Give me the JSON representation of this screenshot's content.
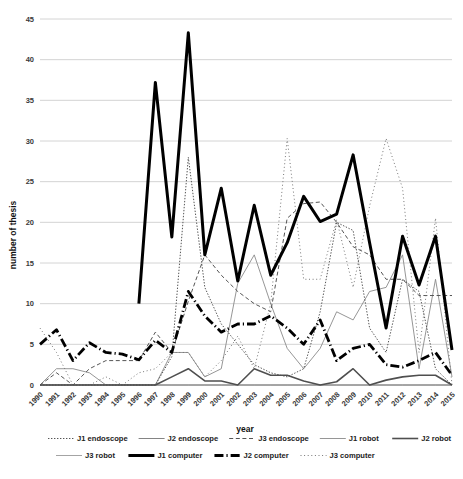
{
  "chart_data": {
    "type": "line",
    "title": "",
    "xlabel": "year",
    "ylabel": "number of thesis",
    "grid": true,
    "legend_position": "bottom",
    "ylim": [
      0,
      45
    ],
    "yticks": [
      0,
      5,
      10,
      15,
      20,
      25,
      30,
      35,
      40,
      45
    ],
    "categories": [
      "1990",
      "1991",
      "1992",
      "1993",
      "1994",
      "1995",
      "1996",
      "1997",
      "1998",
      "1999",
      "2000",
      "2001",
      "2002",
      "2003",
      "2004",
      "2005",
      "2006",
      "2007",
      "2008",
      "2009",
      "2010",
      "2011",
      "2012",
      "2013",
      "2014",
      "2015"
    ],
    "series": [
      {
        "name": "J1 endoscope",
        "style": "dotted-fine",
        "color": "#555555",
        "width": 1.0,
        "dash": "1.4,1.6",
        "values": [
          0,
          0,
          0,
          0,
          0,
          0,
          0,
          0,
          3.5,
          28,
          12,
          7.5,
          5,
          2.5,
          1.5,
          1,
          2,
          9,
          20,
          19,
          7,
          4,
          13,
          11.5,
          2,
          0
        ]
      },
      {
        "name": "J2 endoscope",
        "style": "thin-solid",
        "color": "#6e6e6e",
        "width": 0.85,
        "dash": "",
        "values": [
          0,
          0,
          0,
          0,
          0,
          0,
          0,
          0,
          0,
          0,
          0,
          0,
          0,
          0,
          0,
          0,
          0,
          0,
          0,
          0,
          0,
          0,
          0,
          0,
          0,
          0
        ]
      },
      {
        "name": "J3 endoscope",
        "style": "dashed",
        "color": "#555555",
        "width": 1.0,
        "dash": "4,2.6",
        "values": [
          0,
          1.5,
          0,
          2,
          3,
          3,
          3,
          6.5,
          4,
          10.3,
          16,
          13.5,
          11.5,
          10,
          9,
          20.5,
          22.3,
          22.5,
          20,
          17,
          16,
          13,
          13,
          11,
          11,
          11
        ]
      },
      {
        "name": "J1 robot",
        "style": "thin-solid",
        "color": "#8a8a8a",
        "width": 0.9,
        "dash": "",
        "values": [
          0,
          2,
          2,
          1.5,
          0,
          0,
          0,
          0,
          4,
          4,
          1,
          2,
          12.5,
          16,
          10,
          4.5,
          2,
          4.5,
          9,
          8,
          11.5,
          12,
          16,
          2,
          13,
          1
        ]
      },
      {
        "name": "J2 robot",
        "style": "medium-grey",
        "color": "#4f4f4f",
        "width": 1.6,
        "dash": "",
        "values": [
          0,
          0,
          0,
          0,
          0,
          0,
          0,
          0,
          1,
          2,
          0.5,
          0.5,
          0,
          2,
          1.2,
          1.2,
          0.5,
          0,
          0.4,
          2,
          0,
          0.6,
          1,
          1.2,
          1.2,
          0
        ]
      },
      {
        "name": "J3 robot",
        "style": "thin-solid",
        "color": "#9a9a9a",
        "width": 0.9,
        "dash": "",
        "values": [
          0,
          0,
          0,
          0,
          0,
          0,
          0,
          0,
          0,
          0,
          0,
          0,
          0,
          0,
          0,
          0,
          0,
          0,
          0,
          0,
          0,
          0,
          0,
          0,
          0,
          0
        ]
      },
      {
        "name": "J1 computer",
        "style": "thick-solid",
        "color": "#000000",
        "width": 3.0,
        "dash": "",
        "values": [
          null,
          null,
          null,
          null,
          null,
          null,
          10,
          37.2,
          18.2,
          43.3,
          16,
          24.2,
          12.8,
          22.1,
          13.5,
          17.5,
          23.2,
          20.1,
          21,
          28.3,
          17.5,
          7,
          18.3,
          12.3,
          18.3,
          4.3
        ]
      },
      {
        "name": "J2 computer",
        "style": "thick-dashdot",
        "color": "#000000",
        "width": 2.8,
        "dash": "9,3,1.2,3",
        "values": [
          5,
          6.8,
          3,
          5.2,
          4,
          3.8,
          3.1,
          5.5,
          4,
          11.5,
          8.5,
          6.5,
          7.5,
          7.5,
          8.5,
          7,
          5,
          8,
          3,
          4.5,
          5,
          2.5,
          2.2,
          3,
          4,
          1.2
        ]
      },
      {
        "name": "J3 computer",
        "style": "dotted-sparse",
        "color": "#777777",
        "width": 1.0,
        "dash": "1,2.6",
        "values": [
          7,
          4,
          0,
          0,
          1,
          0,
          1.5,
          2,
          4,
          4,
          1,
          3,
          6,
          2,
          10,
          30.3,
          13,
          13,
          20.3,
          12,
          22,
          30.3,
          24.2,
          4,
          20.5,
          0
        ]
      }
    ]
  },
  "legend": {
    "rows": [
      [
        {
          "label": "J1 endoscope",
          "marker": "dotted-fine"
        },
        {
          "label": "J2 endoscope",
          "marker": "thin-solid"
        },
        {
          "label": "J3 endoscope",
          "marker": "dashed"
        },
        {
          "label": "J1 robot",
          "marker": "thin-solid"
        },
        {
          "label": "J2 robot",
          "marker": "medium-grey"
        }
      ],
      [
        {
          "label": "J3 robot",
          "marker": "thin-solid"
        },
        {
          "label": "J1 computer",
          "marker": "thick-solid"
        },
        {
          "label": "J2 computer",
          "marker": "thick-solid"
        },
        {
          "label": "J3 computer",
          "marker": "dotted-sparse"
        }
      ]
    ]
  }
}
